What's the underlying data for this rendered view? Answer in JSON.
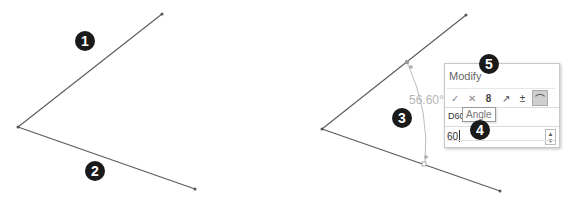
{
  "figure_left": {
    "lines": [
      {
        "id": "line-1",
        "x1": 18,
        "y1": 127,
        "x2": 162,
        "y2": 14
      },
      {
        "id": "line-2",
        "x1": 18,
        "y1": 127,
        "x2": 195,
        "y2": 189
      }
    ],
    "markers": [
      {
        "label": "1",
        "x": 85,
        "y": 41
      },
      {
        "label": "2",
        "x": 95,
        "y": 171
      }
    ]
  },
  "figure_right": {
    "lines": [
      {
        "id": "line-upper",
        "x1": 322,
        "y1": 129,
        "x2": 466,
        "y2": 15
      },
      {
        "id": "line-lower",
        "x1": 322,
        "y1": 129,
        "x2": 500,
        "y2": 191
      }
    ],
    "angle_dimension": {
      "value": "56.60°"
    },
    "markers": [
      {
        "label": "3",
        "x": 410,
        "y": 117
      },
      {
        "label": "4",
        "x": 480,
        "y": 130
      },
      {
        "label": "5",
        "x": 489,
        "y": 64
      }
    ]
  },
  "modify_dialog": {
    "title": "Modify",
    "toolbar": [
      {
        "name": "ok-icon",
        "glyph": "✓"
      },
      {
        "name": "cancel-icon",
        "glyph": "✕"
      },
      {
        "name": "rebuild-icon",
        "glyph": "8"
      },
      {
        "name": "reverse-direction-icon",
        "glyph": "↗"
      },
      {
        "name": "mark-dimension-icon",
        "glyph": "±"
      },
      {
        "name": "angle-dimension-icon",
        "glyph": "⌒"
      }
    ],
    "dimension_name": "D60",
    "tooltip": "Angle",
    "value": "60"
  },
  "colors": {
    "sketch_line": "#5a5a5a",
    "dimension": "#b5b5b5",
    "marker_bg": "#1a1a1a",
    "annotation_arrow": "#1a1a1a"
  }
}
